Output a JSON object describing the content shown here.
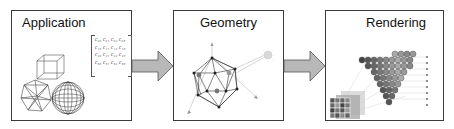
{
  "diagram": {
    "stages": [
      {
        "id": "application",
        "label": "Application"
      },
      {
        "id": "geometry",
        "label": "Geometry"
      },
      {
        "id": "rendering",
        "label": "Rendering"
      }
    ],
    "arrows": [
      {
        "from": "application",
        "to": "geometry"
      },
      {
        "from": "geometry",
        "to": "rendering"
      }
    ],
    "application_matrix": {
      "rows": [
        "c₀₀ c₀₁ c₀₂ c₀₃",
        "c₁₀ c₁₁ c₁₂ c₁₃",
        "c₂₀ c₂₁ c₂₂ c₂₃",
        "c₃₀ c₃₁ c₃₂ c₃₃"
      ]
    },
    "application_objects": [
      "cube-wireframe",
      "icosahedron-wireframe",
      "sphere-wireframe"
    ],
    "geometry_objects": [
      "icosahedron-vertices",
      "light-source",
      "axes"
    ],
    "rendering_objects": [
      "rasterized-triangle-pixels",
      "pixel-grid"
    ],
    "colors": {
      "border": "#3a3a3a",
      "arrow_fill": "#b8b8b8",
      "arrow_stroke": "#555555",
      "line": "#333333",
      "light": "#d8d8d8"
    }
  }
}
